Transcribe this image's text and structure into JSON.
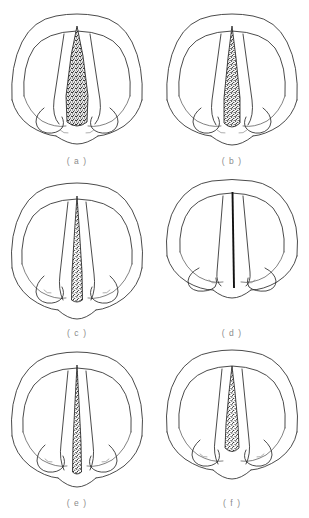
{
  "figure": {
    "kind": "anatomical-line-drawing-grid",
    "background_color": "#ffffff",
    "ink_color": "#2b2b2b",
    "label_color": "#8b8b8b",
    "columns": 2,
    "rows": 3,
    "panel_count": 6
  },
  "panels": [
    {
      "id": "a",
      "label": "( a )",
      "position": {
        "row": 1,
        "column": 1
      },
      "glottis": {
        "shape": "wide-triangular",
        "texture": "stipple",
        "aperture": "wide",
        "top_width_px": 6,
        "max_width_px": 34,
        "length_px": 108,
        "reaches_bottom": true
      }
    },
    {
      "id": "b",
      "label": "( b )",
      "position": {
        "row": 1,
        "column": 2
      },
      "glottis": {
        "shape": "narrow-triangular",
        "texture": "stipple",
        "aperture": "medium-wide",
        "top_width_px": 4,
        "max_width_px": 24,
        "length_px": 108,
        "reaches_bottom": true
      }
    },
    {
      "id": "c",
      "label": "( c )",
      "position": {
        "row": 2,
        "column": 1
      },
      "glottis": {
        "shape": "slender-wedge",
        "texture": "stipple",
        "aperture": "narrow",
        "top_width_px": 3,
        "max_width_px": 15,
        "length_px": 110,
        "reaches_bottom": true
      }
    },
    {
      "id": "d",
      "label": "( d )",
      "position": {
        "row": 2,
        "column": 2
      },
      "glottis": {
        "shape": "closed-line",
        "texture": "solid-line",
        "aperture": "closed",
        "top_width_px": 1,
        "max_width_px": 2,
        "length_px": 108,
        "reaches_bottom": true
      }
    },
    {
      "id": "e",
      "label": "( e )",
      "position": {
        "row": 3,
        "column": 1
      },
      "glottis": {
        "shape": "slender-wedge",
        "texture": "stipple",
        "aperture": "narrow",
        "top_width_px": 3,
        "max_width_px": 13,
        "length_px": 112,
        "reaches_bottom": true
      }
    },
    {
      "id": "f",
      "label": "( f )",
      "position": {
        "row": 3,
        "column": 2
      },
      "glottis": {
        "shape": "tapered-wedge-short",
        "texture": "stipple",
        "aperture": "narrow-anterior",
        "top_width_px": 5,
        "max_width_px": 16,
        "length_px": 88,
        "reaches_bottom": false
      }
    }
  ]
}
